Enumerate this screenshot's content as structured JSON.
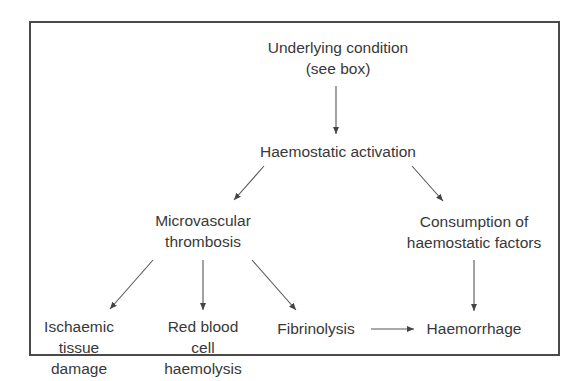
{
  "diagram": {
    "type": "flowchart",
    "nodes": {
      "underlying": {
        "lines": [
          "Underlying condition",
          "(see box)"
        ]
      },
      "activation": {
        "lines": [
          "Haemostatic activation"
        ]
      },
      "thrombosis": {
        "lines": [
          "Microvascular",
          "thrombosis"
        ]
      },
      "consumption": {
        "lines": [
          "Consumption of",
          "haemostatic factors"
        ]
      },
      "ischaemic": {
        "lines": [
          "Ischaemic",
          "tissue",
          "damage"
        ]
      },
      "haemolysis": {
        "lines": [
          "Red blood",
          "cell",
          "haemolysis"
        ]
      },
      "fibrinolysis": {
        "lines": [
          "Fibrinolysis"
        ]
      },
      "haemorrhage": {
        "lines": [
          "Haemorrhage"
        ]
      }
    },
    "edges": [
      {
        "from": "Underlying condition (see box)",
        "to": "Haemostatic activation"
      },
      {
        "from": "Haemostatic activation",
        "to": "Microvascular thrombosis"
      },
      {
        "from": "Haemostatic activation",
        "to": "Consumption of haemostatic factors"
      },
      {
        "from": "Microvascular thrombosis",
        "to": "Ischaemic tissue damage"
      },
      {
        "from": "Microvascular thrombosis",
        "to": "Red blood cell haemolysis"
      },
      {
        "from": "Microvascular thrombosis",
        "to": "Fibrinolysis"
      },
      {
        "from": "Fibrinolysis",
        "to": "Haemorrhage"
      },
      {
        "from": "Consumption of haemostatic factors",
        "to": "Haemorrhage"
      }
    ],
    "colors": {
      "text": "#383838",
      "line": "#4a4a4a",
      "background": "#ffffff"
    }
  }
}
